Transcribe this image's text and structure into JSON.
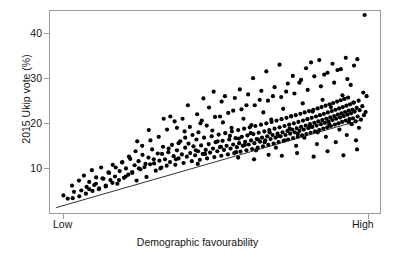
{
  "figure": {
    "background": "#ffffff",
    "point_color": "#000000",
    "frame_color": "#9a9a9a"
  },
  "axes": {
    "y_title": "2015 Ukip vote (%)",
    "x_title": "Demographic favourability",
    "y_ticks": [
      "10",
      "20",
      "30",
      "40"
    ],
    "x_ticks": [
      "Low",
      "High"
    ]
  },
  "chart_data": {
    "type": "scatter",
    "title": "",
    "xlabel": "Demographic favourability",
    "ylabel": "2015 Ukip vote (%)",
    "xlim": [
      0,
      100
    ],
    "ylim": [
      0,
      45
    ],
    "grid": false,
    "legend": null,
    "x_tick_values": [
      2,
      95
    ],
    "x_tick_labels": [
      "Low",
      "High"
    ],
    "y_tick_values": [
      10,
      20,
      30,
      40
    ],
    "y_tick_labels": [
      "10",
      "20",
      "30",
      "40"
    ],
    "trendline": {
      "x0": 2.0,
      "y0": 1.3,
      "x1": 94.0,
      "y1": 20.7
    },
    "n_points": 372,
    "points": [
      [
        4.2,
        4.0
      ],
      [
        5.5,
        3.3
      ],
      [
        6.8,
        6.2
      ],
      [
        7.4,
        4.8
      ],
      [
        8.9,
        7.3
      ],
      [
        9.6,
        5.1
      ],
      [
        10.4,
        8.4
      ],
      [
        11.2,
        5.9
      ],
      [
        12.0,
        7.0
      ],
      [
        12.8,
        9.6
      ],
      [
        13.5,
        6.3
      ],
      [
        14.1,
        8.0
      ],
      [
        14.9,
        5.4
      ],
      [
        15.6,
        10.2
      ],
      [
        16.3,
        7.7
      ],
      [
        17.0,
        6.0
      ],
      [
        17.8,
        9.1
      ],
      [
        18.4,
        7.4
      ],
      [
        19.1,
        10.8
      ],
      [
        19.8,
        8.2
      ],
      [
        20.5,
        6.6
      ],
      [
        21.2,
        9.4
      ],
      [
        21.9,
        11.3
      ],
      [
        22.5,
        7.9
      ],
      [
        23.1,
        10.0
      ],
      [
        23.8,
        8.6
      ],
      [
        24.4,
        12.1
      ],
      [
        25.0,
        9.2
      ],
      [
        25.7,
        10.7
      ],
      [
        26.3,
        7.3
      ],
      [
        26.9,
        11.6
      ],
      [
        27.5,
        9.8
      ],
      [
        28.1,
        13.0
      ],
      [
        28.7,
        10.3
      ],
      [
        29.3,
        8.1
      ],
      [
        29.9,
        12.4
      ],
      [
        30.4,
        10.9
      ],
      [
        31.0,
        14.2
      ],
      [
        31.6,
        11.1
      ],
      [
        32.1,
        9.5
      ],
      [
        32.7,
        13.3
      ],
      [
        33.2,
        11.7
      ],
      [
        33.8,
        10.2
      ],
      [
        34.3,
        14.8
      ],
      [
        34.9,
        12.0
      ],
      [
        35.4,
        10.6
      ],
      [
        35.9,
        13.6
      ],
      [
        36.4,
        11.4
      ],
      [
        37.0,
        15.2
      ],
      [
        37.5,
        12.7
      ],
      [
        38.0,
        10.8
      ],
      [
        38.5,
        14.0
      ],
      [
        39.0,
        12.2
      ],
      [
        39.5,
        16.0
      ],
      [
        40.0,
        13.1
      ],
      [
        40.5,
        11.2
      ],
      [
        41.0,
        14.6
      ],
      [
        41.5,
        12.6
      ],
      [
        42.0,
        15.5
      ],
      [
        42.5,
        13.4
      ],
      [
        43.0,
        11.6
      ],
      [
        43.5,
        14.9
      ],
      [
        44.0,
        12.9
      ],
      [
        44.4,
        16.4
      ],
      [
        44.9,
        13.8
      ],
      [
        45.4,
        11.9
      ],
      [
        45.8,
        15.1
      ],
      [
        46.3,
        13.2
      ],
      [
        46.7,
        16.8
      ],
      [
        47.2,
        14.1
      ],
      [
        47.6,
        12.2
      ],
      [
        48.1,
        15.4
      ],
      [
        48.5,
        13.5
      ],
      [
        49.0,
        17.1
      ],
      [
        49.4,
        14.4
      ],
      [
        49.8,
        12.5
      ],
      [
        50.2,
        15.8
      ],
      [
        50.7,
        13.8
      ],
      [
        51.1,
        17.5
      ],
      [
        51.5,
        14.7
      ],
      [
        51.9,
        12.8
      ],
      [
        52.3,
        16.1
      ],
      [
        52.7,
        14.1
      ],
      [
        53.1,
        17.8
      ],
      [
        53.5,
        15.0
      ],
      [
        53.9,
        13.1
      ],
      [
        54.3,
        16.4
      ],
      [
        54.7,
        14.4
      ],
      [
        55.1,
        18.2
      ],
      [
        55.5,
        15.3
      ],
      [
        55.8,
        13.4
      ],
      [
        56.2,
        16.7
      ],
      [
        56.6,
        14.7
      ],
      [
        57.0,
        18.5
      ],
      [
        57.3,
        15.6
      ],
      [
        57.7,
        13.7
      ],
      [
        58.1,
        17.0
      ],
      [
        58.4,
        15.0
      ],
      [
        58.8,
        18.8
      ],
      [
        59.1,
        15.9
      ],
      [
        59.5,
        14.0
      ],
      [
        59.8,
        17.3
      ],
      [
        60.2,
        15.3
      ],
      [
        60.5,
        19.1
      ],
      [
        60.9,
        16.2
      ],
      [
        61.2,
        14.3
      ],
      [
        61.6,
        17.6
      ],
      [
        61.9,
        15.6
      ],
      [
        62.2,
        19.4
      ],
      [
        62.6,
        16.5
      ],
      [
        62.9,
        14.6
      ],
      [
        63.2,
        17.9
      ],
      [
        63.6,
        15.9
      ],
      [
        63.9,
        19.7
      ],
      [
        64.2,
        16.8
      ],
      [
        64.5,
        14.9
      ],
      [
        64.9,
        18.2
      ],
      [
        65.2,
        16.2
      ],
      [
        65.5,
        20.0
      ],
      [
        65.8,
        17.1
      ],
      [
        66.1,
        15.2
      ],
      [
        66.4,
        18.5
      ],
      [
        66.8,
        16.5
      ],
      [
        67.1,
        20.3
      ],
      [
        67.4,
        17.4
      ],
      [
        67.7,
        15.5
      ],
      [
        68.0,
        18.8
      ],
      [
        68.3,
        16.8
      ],
      [
        68.6,
        20.6
      ],
      [
        68.9,
        17.7
      ],
      [
        69.2,
        15.8
      ],
      [
        69.5,
        19.1
      ],
      [
        69.8,
        17.1
      ],
      [
        70.1,
        20.9
      ],
      [
        70.4,
        18.0
      ],
      [
        70.7,
        16.1
      ],
      [
        71.0,
        19.4
      ],
      [
        71.3,
        17.4
      ],
      [
        71.6,
        21.2
      ],
      [
        71.9,
        18.3
      ],
      [
        72.1,
        16.4
      ],
      [
        72.4,
        19.7
      ],
      [
        72.7,
        17.7
      ],
      [
        73.0,
        21.5
      ],
      [
        73.3,
        18.6
      ],
      [
        73.6,
        16.7
      ],
      [
        73.8,
        20.0
      ],
      [
        74.1,
        18.0
      ],
      [
        74.4,
        21.8
      ],
      [
        74.7,
        18.9
      ],
      [
        75.0,
        17.0
      ],
      [
        75.2,
        20.3
      ],
      [
        75.5,
        18.3
      ],
      [
        75.8,
        22.1
      ],
      [
        76.0,
        19.2
      ],
      [
        76.3,
        17.3
      ],
      [
        76.6,
        20.6
      ],
      [
        76.8,
        18.6
      ],
      [
        77.1,
        22.4
      ],
      [
        77.4,
        19.5
      ],
      [
        77.6,
        17.6
      ],
      [
        77.9,
        20.9
      ],
      [
        78.2,
        18.9
      ],
      [
        78.4,
        22.7
      ],
      [
        78.7,
        19.8
      ],
      [
        78.9,
        17.9
      ],
      [
        79.2,
        21.2
      ],
      [
        79.4,
        19.2
      ],
      [
        79.7,
        23.0
      ],
      [
        80.0,
        20.1
      ],
      [
        80.2,
        18.2
      ],
      [
        80.5,
        21.5
      ],
      [
        80.7,
        19.5
      ],
      [
        81.0,
        23.3
      ],
      [
        81.2,
        20.4
      ],
      [
        81.5,
        18.5
      ],
      [
        81.7,
        21.8
      ],
      [
        82.0,
        19.8
      ],
      [
        82.2,
        23.6
      ],
      [
        82.4,
        20.7
      ],
      [
        82.7,
        18.8
      ],
      [
        82.9,
        22.1
      ],
      [
        83.2,
        20.1
      ],
      [
        83.4,
        23.9
      ],
      [
        83.6,
        21.0
      ],
      [
        83.9,
        19.1
      ],
      [
        84.1,
        22.4
      ],
      [
        84.3,
        20.4
      ],
      [
        84.6,
        24.2
      ],
      [
        84.8,
        21.3
      ],
      [
        85.0,
        19.4
      ],
      [
        85.3,
        22.7
      ],
      [
        85.5,
        20.7
      ],
      [
        85.7,
        24.5
      ],
      [
        86.0,
        21.6
      ],
      [
        86.2,
        19.7
      ],
      [
        86.4,
        23.0
      ],
      [
        86.6,
        21.0
      ],
      [
        86.9,
        24.8
      ],
      [
        87.1,
        21.9
      ],
      [
        87.3,
        20.0
      ],
      [
        87.5,
        23.3
      ],
      [
        87.8,
        21.3
      ],
      [
        88.0,
        25.1
      ],
      [
        88.2,
        22.2
      ],
      [
        88.4,
        20.3
      ],
      [
        88.6,
        23.6
      ],
      [
        88.9,
        21.6
      ],
      [
        89.1,
        25.4
      ],
      [
        89.3,
        22.5
      ],
      [
        89.5,
        20.6
      ],
      [
        89.7,
        23.9
      ],
      [
        90.0,
        21.9
      ],
      [
        90.2,
        25.7
      ],
      [
        90.4,
        22.8
      ],
      [
        90.6,
        20.9
      ],
      [
        90.8,
        24.2
      ],
      [
        91.1,
        22.2
      ],
      [
        91.3,
        19.8
      ],
      [
        91.5,
        23.0
      ],
      [
        91.7,
        21.1
      ],
      [
        92.0,
        24.6
      ],
      [
        92.2,
        22.6
      ],
      [
        92.5,
        20.4
      ],
      [
        92.8,
        23.4
      ],
      [
        93.1,
        21.5
      ],
      [
        93.4,
        25.0
      ],
      [
        93.7,
        22.9
      ],
      [
        94.1,
        20.8
      ],
      [
        94.5,
        23.8
      ],
      [
        95.0,
        21.8
      ],
      [
        33.0,
        17.0
      ],
      [
        35.5,
        18.6
      ],
      [
        37.8,
        20.4
      ],
      [
        40.2,
        21.0
      ],
      [
        42.4,
        19.2
      ],
      [
        44.6,
        22.0
      ],
      [
        46.0,
        20.6
      ],
      [
        48.2,
        23.5
      ],
      [
        50.0,
        21.4
      ],
      [
        52.0,
        24.8
      ],
      [
        54.0,
        22.3
      ],
      [
        56.0,
        25.6
      ],
      [
        58.0,
        23.1
      ],
      [
        60.0,
        26.4
      ],
      [
        62.0,
        24.0
      ],
      [
        64.0,
        27.2
      ],
      [
        66.0,
        25.0
      ],
      [
        68.0,
        28.0
      ],
      [
        70.0,
        25.8
      ],
      [
        72.0,
        28.8
      ],
      [
        74.0,
        26.6
      ],
      [
        76.0,
        29.6
      ],
      [
        78.0,
        27.4
      ],
      [
        80.0,
        30.4
      ],
      [
        82.0,
        28.2
      ],
      [
        84.0,
        31.2
      ],
      [
        86.0,
        29.0
      ],
      [
        88.0,
        32.0
      ],
      [
        90.0,
        29.8
      ],
      [
        92.0,
        32.8
      ],
      [
        30.5,
        16.2
      ],
      [
        28.0,
        15.0
      ],
      [
        26.0,
        13.8
      ],
      [
        24.0,
        12.6
      ],
      [
        22.0,
        11.4
      ],
      [
        20.0,
        10.2
      ],
      [
        18.0,
        9.0
      ],
      [
        16.0,
        7.8
      ],
      [
        14.0,
        6.6
      ],
      [
        12.0,
        5.4
      ],
      [
        53.0,
        26.0
      ],
      [
        57.5,
        27.5
      ],
      [
        61.5,
        30.0
      ],
      [
        65.5,
        31.5
      ],
      [
        69.5,
        33.0
      ],
      [
        73.5,
        30.5
      ],
      [
        77.5,
        32.2
      ],
      [
        81.5,
        34.0
      ],
      [
        85.5,
        33.2
      ],
      [
        89.5,
        34.5
      ],
      [
        93.0,
        34.2
      ],
      [
        95.2,
        44.0
      ],
      [
        79.0,
        33.5
      ],
      [
        83.0,
        30.8
      ],
      [
        87.0,
        31.8
      ],
      [
        91.0,
        28.5
      ],
      [
        75.5,
        29.0
      ],
      [
        71.5,
        27.0
      ],
      [
        67.5,
        26.0
      ],
      [
        63.5,
        25.2
      ],
      [
        59.5,
        24.0
      ],
      [
        55.5,
        22.8
      ],
      [
        51.5,
        21.5
      ],
      [
        47.5,
        19.5
      ],
      [
        45.0,
        18.0
      ],
      [
        41.0,
        16.8
      ],
      [
        39.0,
        15.6
      ],
      [
        36.0,
        14.4
      ],
      [
        34.0,
        13.2
      ],
      [
        31.5,
        12.0
      ],
      [
        29.0,
        11.0
      ],
      [
        27.0,
        10.0
      ],
      [
        25.0,
        9.0
      ],
      [
        23.0,
        8.2
      ],
      [
        21.0,
        7.4
      ],
      [
        19.0,
        6.8
      ],
      [
        17.0,
        6.2
      ],
      [
        15.0,
        5.6
      ],
      [
        13.0,
        5.0
      ],
      [
        11.0,
        4.4
      ],
      [
        9.0,
        3.8
      ],
      [
        7.0,
        3.4
      ],
      [
        36.5,
        21.5
      ],
      [
        38.5,
        19.0
      ],
      [
        40.8,
        18.2
      ],
      [
        43.2,
        17.4
      ],
      [
        45.6,
        20.0
      ],
      [
        49.2,
        18.4
      ],
      [
        52.4,
        20.2
      ],
      [
        55.0,
        19.0
      ],
      [
        58.6,
        21.0
      ],
      [
        61.0,
        19.6
      ],
      [
        64.6,
        22.4
      ],
      [
        67.0,
        20.8
      ],
      [
        70.6,
        23.2
      ],
      [
        73.0,
        21.6
      ],
      [
        76.5,
        24.4
      ],
      [
        79.5,
        22.6
      ],
      [
        82.5,
        25.2
      ],
      [
        85.0,
        23.6
      ],
      [
        88.5,
        26.2
      ],
      [
        91.8,
        24.6
      ],
      [
        94.8,
        26.8
      ],
      [
        50.8,
        16.0
      ],
      [
        54.5,
        17.2
      ],
      [
        57.2,
        16.6
      ],
      [
        60.8,
        17.8
      ],
      [
        63.0,
        16.4
      ],
      [
        66.5,
        18.0
      ],
      [
        69.0,
        17.2
      ],
      [
        72.5,
        18.8
      ],
      [
        75.0,
        17.6
      ],
      [
        78.6,
        19.2
      ],
      [
        81.0,
        18.0
      ],
      [
        84.5,
        19.8
      ],
      [
        87.6,
        18.6
      ],
      [
        90.5,
        20.2
      ],
      [
        93.5,
        19.0
      ],
      [
        44.2,
        14.0
      ],
      [
        47.0,
        13.2
      ],
      [
        51.8,
        14.8
      ],
      [
        56.4,
        13.6
      ],
      [
        59.0,
        15.2
      ],
      [
        62.4,
        14.0
      ],
      [
        65.0,
        15.8
      ],
      [
        68.4,
        14.6
      ],
      [
        71.0,
        16.2
      ],
      [
        74.5,
        15.0
      ],
      [
        77.0,
        16.8
      ],
      [
        80.8,
        15.4
      ],
      [
        83.5,
        17.0
      ],
      [
        86.5,
        15.8
      ],
      [
        89.8,
        17.4
      ],
      [
        92.6,
        16.2
      ],
      [
        30.0,
        18.5
      ],
      [
        26.5,
        16.0
      ],
      [
        34.5,
        21.0
      ],
      [
        41.8,
        24.0
      ],
      [
        46.5,
        25.5
      ],
      [
        49.6,
        27.0
      ],
      [
        44.8,
        11.0
      ],
      [
        38.2,
        12.0
      ],
      [
        33.5,
        10.0
      ],
      [
        57.0,
        12.4
      ],
      [
        61.8,
        12.0
      ],
      [
        66.2,
        13.0
      ],
      [
        70.2,
        12.8
      ],
      [
        74.8,
        13.4
      ],
      [
        79.8,
        12.6
      ],
      [
        84.0,
        13.8
      ],
      [
        88.8,
        12.9
      ],
      [
        92.9,
        14.2
      ],
      [
        95.5,
        22.5
      ],
      [
        95.8,
        26.0
      ]
    ]
  }
}
